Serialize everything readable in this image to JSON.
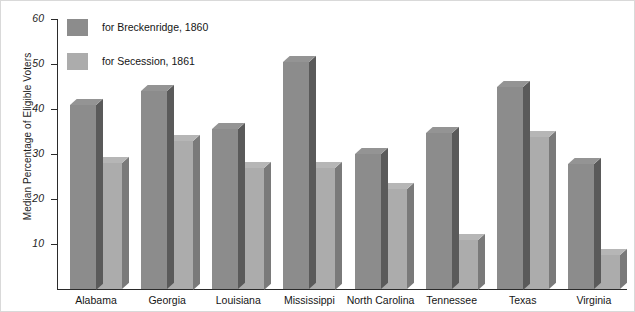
{
  "chart_data": {
    "type": "bar",
    "title": "",
    "xlabel": "",
    "ylabel": "Median Percentage of Eligible Voters",
    "ylim": [
      0,
      60
    ],
    "yticks": [
      10,
      20,
      30,
      40,
      50,
      60
    ],
    "grid": false,
    "legend_position": "top-left",
    "categories": [
      "Alabama",
      "Georgia",
      "Louisiana",
      "Mississippi",
      "North Carolina",
      "Tennessee",
      "Texas",
      "Virginia"
    ],
    "series": [
      {
        "name": "for Breckenridge, 1860",
        "color": "#8c8c8c",
        "side_color": "#5a5a5a",
        "values": [
          41,
          44,
          35.5,
          50.5,
          30,
          34.7,
          45,
          27.8
        ]
      },
      {
        "name": "for Secession, 1861",
        "color": "#acacac",
        "side_color": "#7a7a7a",
        "values": [
          28,
          33,
          27,
          27,
          22.3,
          11,
          33.7,
          7.5
        ]
      }
    ]
  },
  "legend": {
    "items": [
      {
        "label": "for Breckenridge, 1860",
        "color": "#8c8c8c"
      },
      {
        "label": "for Secession, 1861",
        "color": "#acacac"
      }
    ]
  }
}
